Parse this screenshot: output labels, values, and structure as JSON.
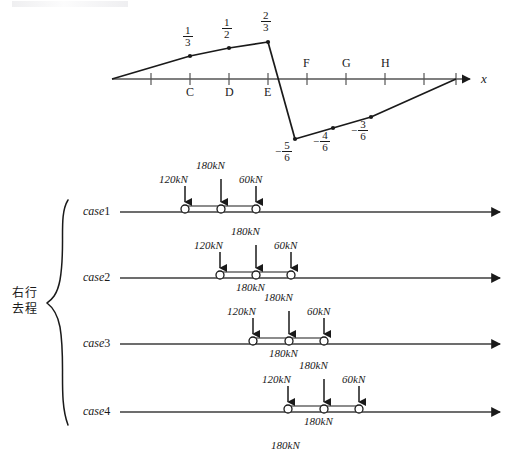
{
  "figure": {
    "type": "influence-line-with-load-cases",
    "axis_label": "x"
  },
  "influence_line": {
    "axis_point_labels": [
      "C",
      "D",
      "E",
      "F",
      "G",
      "H"
    ],
    "positive_values": [
      "1/3",
      "1/2",
      "2/3"
    ],
    "positive_numerators": [
      "1",
      "1",
      "2"
    ],
    "positive_denominators": [
      "3",
      "2",
      "3"
    ],
    "negative_values": [
      "-5/6",
      "-4/6",
      "-3/6"
    ],
    "negative_numerators": [
      "5",
      "4",
      "3"
    ],
    "negative_denominators": [
      "6",
      "6",
      "6"
    ],
    "minus_sign": "−",
    "peak_at": "E",
    "zero_crossing_between": [
      "E",
      "F"
    ],
    "min_at": "F"
  },
  "group": {
    "brace_label_line1": "右行",
    "brace_label_line2": "去程"
  },
  "loads": {
    "left": "120kN",
    "middle": "180kN",
    "right": "60kN",
    "below": "180kN",
    "left_value": 120,
    "middle_value": 180,
    "right_value": 60
  },
  "cases": [
    {
      "name_italic": "case",
      "name_number": "1",
      "label": "case1"
    },
    {
      "name_italic": "case",
      "name_number": "2",
      "label": "case2"
    },
    {
      "name_italic": "case",
      "name_number": "3",
      "label": "case3"
    },
    {
      "name_italic": "case",
      "name_number": "4",
      "label": "case4"
    }
  ],
  "colors": {
    "ink": "#1a1a1a",
    "rule": "#4a4a4a",
    "background": "#ffffff"
  }
}
